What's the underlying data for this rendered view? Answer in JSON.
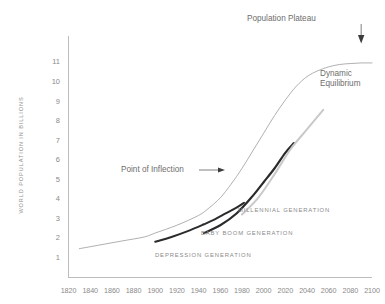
{
  "chart_data": {
    "type": "line",
    "title": "",
    "xlabel": "",
    "ylabel": "WORLD POPULATION IN BILLIONS",
    "xlim": [
      1820,
      2100
    ],
    "ylim": [
      0,
      11.6
    ],
    "grid": false,
    "legend_position": "inline-annotations",
    "xticks": [
      "1820",
      "1840",
      "1860",
      "1880",
      "1900",
      "1920",
      "1940",
      "1960",
      "1980",
      "2000",
      "2020",
      "2040",
      "2060",
      "2080",
      "2100"
    ],
    "yticks": [
      "1",
      "2",
      "3",
      "4",
      "5",
      "6",
      "7",
      "8",
      "9",
      "10",
      "11"
    ],
    "series": [
      {
        "name": "World Population",
        "color": "#8e8e8e",
        "width": 0.7,
        "points": [
          [
            1830,
            1.5
          ],
          [
            1850,
            1.7
          ],
          [
            1870,
            1.9
          ],
          [
            1890,
            2.1
          ],
          [
            1900,
            2.3
          ],
          [
            1920,
            2.7
          ],
          [
            1940,
            3.2
          ],
          [
            1950,
            3.6
          ],
          [
            1960,
            4.1
          ],
          [
            1970,
            4.8
          ],
          [
            1980,
            5.6
          ],
          [
            1990,
            6.5
          ],
          [
            2000,
            7.4
          ],
          [
            2010,
            8.3
          ],
          [
            2020,
            9.1
          ],
          [
            2030,
            9.8
          ],
          [
            2040,
            10.3
          ],
          [
            2050,
            10.6
          ],
          [
            2060,
            10.8
          ],
          [
            2070,
            10.92
          ],
          [
            2080,
            10.97
          ],
          [
            2090,
            11.0
          ],
          [
            2100,
            11.0
          ]
        ]
      },
      {
        "name": "DEPRESSION GENERATION",
        "color": "#2b2b2b",
        "width": 2.0,
        "points": [
          [
            1900,
            1.85
          ],
          [
            1915,
            2.1
          ],
          [
            1930,
            2.4
          ],
          [
            1945,
            2.75
          ],
          [
            1955,
            3.0
          ],
          [
            1965,
            3.3
          ],
          [
            1975,
            3.6
          ],
          [
            1982,
            3.85
          ]
        ]
      },
      {
        "name": "BABY BOOM GENERATION",
        "color": "#2b2b2b",
        "width": 2.2,
        "points": [
          [
            1945,
            2.3
          ],
          [
            1960,
            2.7
          ],
          [
            1975,
            3.3
          ],
          [
            1990,
            4.2
          ],
          [
            2000,
            4.9
          ],
          [
            2010,
            5.6
          ],
          [
            2020,
            6.4
          ],
          [
            2028,
            6.9
          ]
        ]
      },
      {
        "name": "MILLENNIAL GENERATION",
        "color": "#c9c9c9",
        "width": 2.0,
        "points": [
          [
            1980,
            3.25
          ],
          [
            1995,
            4.1
          ],
          [
            2010,
            5.3
          ],
          [
            2025,
            6.6
          ],
          [
            2040,
            7.6
          ],
          [
            2055,
            8.6
          ]
        ]
      }
    ],
    "annotations": [
      {
        "name": "population-plateau",
        "text": "Population Plateau",
        "target_x": 2090,
        "target_y": 11.0
      },
      {
        "name": "dynamic-equilibrium",
        "line1": "Dynamic",
        "line2": "Equilibrium"
      },
      {
        "name": "point-of-inflection",
        "text": "Point of Inflection",
        "target_x": 2000,
        "target_y": 7.4
      },
      {
        "name": "millennial-generation",
        "text": "MILLENNIAL GENERATION"
      },
      {
        "name": "baby-boom-generation",
        "text": "BABY BOOM GENERATION"
      },
      {
        "name": "depression-generation",
        "text": "DEPRESSION GENERATION"
      }
    ]
  }
}
